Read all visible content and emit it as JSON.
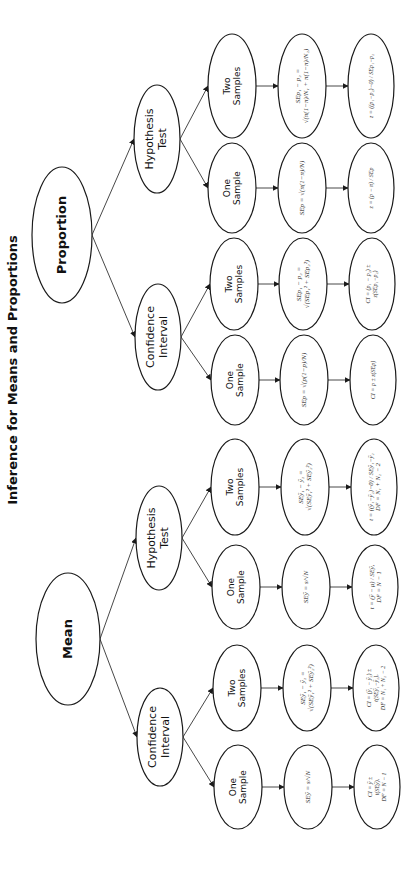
{
  "title": "Inference for Means and Proportions",
  "colors": {
    "stroke": "#1a1a1a",
    "text": "#111111",
    "background": "#ffffff"
  },
  "nodes": [
    {
      "id": "proportion",
      "label": [
        "Proportion"
      ],
      "cx": 62,
      "cy": 235,
      "rx": 30,
      "ry": 68,
      "font": 13,
      "style": "sans bold"
    },
    {
      "id": "mean",
      "label": [
        "Mean"
      ],
      "cx": 68,
      "cy": 639,
      "rx": 32,
      "ry": 66,
      "font": 13,
      "style": "sans bold"
    },
    {
      "id": "prop-ht",
      "label": [
        "Hypothesis",
        "Test"
      ],
      "cx": 157,
      "cy": 139,
      "rx": 23,
      "ry": 54,
      "font": 11,
      "style": "sans"
    },
    {
      "id": "prop-ci",
      "label": [
        "Confidence",
        "Interval"
      ],
      "cx": 158,
      "cy": 337,
      "rx": 23,
      "ry": 53,
      "font": 11,
      "style": "sans"
    },
    {
      "id": "mean-ht",
      "label": [
        "Hypothesis",
        "Test"
      ],
      "cx": 159,
      "cy": 538,
      "rx": 23,
      "ry": 52,
      "font": 11,
      "style": "sans"
    },
    {
      "id": "mean-ci",
      "label": [
        "Confidence",
        "Interval"
      ],
      "cx": 160,
      "cy": 737,
      "rx": 23,
      "ry": 49,
      "font": 11,
      "style": "sans"
    },
    {
      "id": "prop-ht-two",
      "label": [
        "Two",
        "Samples"
      ],
      "cx": 232,
      "cy": 86,
      "rx": 24,
      "ry": 52,
      "font": 9,
      "style": "sans"
    },
    {
      "id": "prop-ht-one",
      "label": [
        "One",
        "Sample"
      ],
      "cx": 232,
      "cy": 188,
      "rx": 24,
      "ry": 45,
      "font": 9,
      "style": "sans"
    },
    {
      "id": "prop-ci-two",
      "label": [
        "Two",
        "Samples"
      ],
      "cx": 234,
      "cy": 284,
      "rx": 24,
      "ry": 46,
      "font": 9,
      "style": "sans"
    },
    {
      "id": "prop-ci-one",
      "label": [
        "One",
        "Sample"
      ],
      "cx": 235,
      "cy": 380,
      "rx": 24,
      "ry": 45,
      "font": 9,
      "style": "sans"
    },
    {
      "id": "mean-ht-two",
      "label": [
        "Two",
        "Samples"
      ],
      "cx": 235,
      "cy": 487,
      "rx": 24,
      "ry": 48,
      "font": 9,
      "style": "sans"
    },
    {
      "id": "mean-ht-one",
      "label": [
        "One",
        "Sample"
      ],
      "cx": 236,
      "cy": 587,
      "rx": 24,
      "ry": 42,
      "font": 9,
      "style": "sans"
    },
    {
      "id": "mean-ci-two",
      "label": [
        "Two",
        "Samples"
      ],
      "cx": 237,
      "cy": 688,
      "rx": 24,
      "ry": 43,
      "font": 9,
      "style": "sans"
    },
    {
      "id": "mean-ci-one",
      "label": [
        "One",
        "Sample"
      ],
      "cx": 238,
      "cy": 787,
      "rx": 24,
      "ry": 42,
      "font": 9,
      "style": "sans"
    },
    {
      "id": "prop-ht-two-se",
      "label": [
        "SEp₁ − p₂ =",
        "√(π(1−π)/N₁ + π(1−π)/N₂)"
      ],
      "cx": 302,
      "cy": 86,
      "rx": 24,
      "ry": 52,
      "font": 7,
      "style": "formula"
    },
    {
      "id": "prop-ht-one-se",
      "label": [
        "SEp = √(π(1−π)/N)"
      ],
      "cx": 302,
      "cy": 188,
      "rx": 24,
      "ry": 45,
      "font": 7,
      "style": "formula"
    },
    {
      "id": "prop-ci-two-se",
      "label": [
        "SEp₁ − p₂ =",
        "√(SEp₁² + SEp₂²)"
      ],
      "cx": 303,
      "cy": 284,
      "rx": 24,
      "ry": 46,
      "font": 7,
      "style": "formula"
    },
    {
      "id": "prop-ci-one-se",
      "label": [
        "SEp = √(p(1−p)/N)"
      ],
      "cx": 304,
      "cy": 380,
      "rx": 24,
      "ry": 45,
      "font": 7,
      "style": "formula"
    },
    {
      "id": "mean-ht-two-se",
      "label": [
        "SEȳ₁ − ȳ₂ =",
        "√(SEȳ₁² + SEȳ₂²)"
      ],
      "cx": 305,
      "cy": 487,
      "rx": 24,
      "ry": 48,
      "font": 7,
      "style": "formula"
    },
    {
      "id": "mean-ht-one-se",
      "label": [
        "SEȳ = s/√N"
      ],
      "cx": 306,
      "cy": 587,
      "rx": 24,
      "ry": 42,
      "font": 7,
      "style": "formula"
    },
    {
      "id": "mean-ci-two-se",
      "label": [
        "SEȳ₁ − ȳ₂ =",
        "√(SEȳ₁² + SEȳ₂²)"
      ],
      "cx": 307,
      "cy": 688,
      "rx": 24,
      "ry": 43,
      "font": 7,
      "style": "formula"
    },
    {
      "id": "mean-ci-one-se",
      "label": [
        "SEȳ = s/√N"
      ],
      "cx": 308,
      "cy": 787,
      "rx": 24,
      "ry": 42,
      "font": 7,
      "style": "formula"
    },
    {
      "id": "prop-ht-two-test",
      "label": [
        "z = ((p₁−p₂)−0) / SEp₁−p₂"
      ],
      "cx": 371,
      "cy": 86,
      "rx": 23,
      "ry": 52,
      "font": 6,
      "style": "formula"
    },
    {
      "id": "prop-ht-one-test",
      "label": [
        "z = (p − π) / SEp"
      ],
      "cx": 371,
      "cy": 188,
      "rx": 23,
      "ry": 45,
      "font": 6,
      "style": "formula"
    },
    {
      "id": "prop-ci-two-test",
      "label": [
        "CI = (p₁ − p₂) ±",
        "z(SEp₁−p₂)"
      ],
      "cx": 372,
      "cy": 284,
      "rx": 23,
      "ry": 46,
      "font": 6,
      "style": "formula"
    },
    {
      "id": "prop-ci-one-test",
      "label": [
        "CI = p ± z(SEp)"
      ],
      "cx": 373,
      "cy": 380,
      "rx": 23,
      "ry": 45,
      "font": 6,
      "style": "formula"
    },
    {
      "id": "mean-ht-two-test",
      "label": [
        "t = ((ȳ₁−ȳ₂)−0) / SEȳ₁−ȳ₂",
        "DF = N₁ + N₂ − 2"
      ],
      "cx": 374,
      "cy": 487,
      "rx": 23,
      "ry": 48,
      "font": 6.5,
      "style": "formula"
    },
    {
      "id": "mean-ht-one-test",
      "label": [
        "t = (ȳ − μ) / SEȳ,",
        "DF = N − 1"
      ],
      "cx": 375,
      "cy": 587,
      "rx": 23,
      "ry": 42,
      "font": 6.5,
      "style": "formula"
    },
    {
      "id": "mean-ci-two-test",
      "label": [
        "CI = (ȳ₁ − ȳ₂) ±",
        "t(SEȳ₁−ȳ₂),",
        "DF = N₁ + N₂ − 2"
      ],
      "cx": 376,
      "cy": 688,
      "rx": 23,
      "ry": 43,
      "font": 6,
      "style": "formula"
    },
    {
      "id": "mean-ci-one-test",
      "label": [
        "CI = ȳ ±",
        "t(SEȳ),",
        "DF = N − 1"
      ],
      "cx": 377,
      "cy": 787,
      "rx": 23,
      "ry": 42,
      "font": 6,
      "style": "formula"
    }
  ],
  "edges": [
    [
      "proportion",
      "prop-ht"
    ],
    [
      "proportion",
      "prop-ci"
    ],
    [
      "mean",
      "mean-ht"
    ],
    [
      "mean",
      "mean-ci"
    ],
    [
      "prop-ht",
      "prop-ht-two"
    ],
    [
      "prop-ht",
      "prop-ht-one"
    ],
    [
      "prop-ci",
      "prop-ci-two"
    ],
    [
      "prop-ci",
      "prop-ci-one"
    ],
    [
      "mean-ht",
      "mean-ht-two"
    ],
    [
      "mean-ht",
      "mean-ht-one"
    ],
    [
      "mean-ci",
      "mean-ci-two"
    ],
    [
      "mean-ci",
      "mean-ci-one"
    ],
    [
      "prop-ht-two",
      "prop-ht-two-se"
    ],
    [
      "prop-ht-one",
      "prop-ht-one-se"
    ],
    [
      "prop-ci-two",
      "prop-ci-two-se"
    ],
    [
      "prop-ci-one",
      "prop-ci-one-se"
    ],
    [
      "mean-ht-two",
      "mean-ht-two-se"
    ],
    [
      "mean-ht-one",
      "mean-ht-one-se"
    ],
    [
      "mean-ci-two",
      "mean-ci-two-se"
    ],
    [
      "mean-ci-one",
      "mean-ci-one-se"
    ],
    [
      "prop-ht-two-se",
      "prop-ht-two-test"
    ],
    [
      "prop-ht-one-se",
      "prop-ht-one-test"
    ],
    [
      "prop-ci-two-se",
      "prop-ci-two-test"
    ],
    [
      "prop-ci-one-se",
      "prop-ci-one-test"
    ],
    [
      "mean-ht-two-se",
      "mean-ht-two-test"
    ],
    [
      "mean-ht-one-se",
      "mean-ht-one-test"
    ],
    [
      "mean-ci-two-se",
      "mean-ci-two-test"
    ],
    [
      "mean-ci-one-se",
      "mean-ci-one-test"
    ]
  ]
}
